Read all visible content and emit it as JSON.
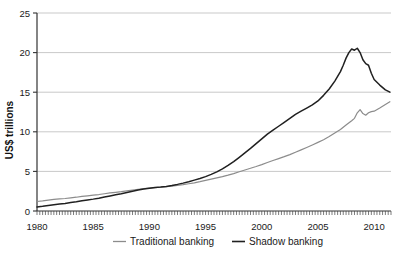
{
  "chart_data": {
    "type": "line",
    "title": "",
    "xlabel": "",
    "ylabel": "US$ trillions",
    "xlim": [
      1980,
      2011.5
    ],
    "ylim": [
      0,
      25
    ],
    "grid": true,
    "legend_position": "bottom",
    "y_ticks": [
      0,
      5,
      10,
      15,
      20,
      25
    ],
    "y_tick_labels": [
      "0",
      "5",
      "10",
      "15",
      "20",
      "25"
    ],
    "x_ticks": [
      1980,
      1985,
      1990,
      1995,
      2000,
      2005,
      2010
    ],
    "x_tick_labels": [
      "1980",
      "1985",
      "1990",
      "1995",
      "2000",
      "2005",
      "2010"
    ],
    "x_minor_tick_step": 0.25,
    "series": [
      {
        "name": "Traditional banking",
        "color": "#8c8c8c",
        "x": [
          1980,
          1980.5,
          1981,
          1981.5,
          1982,
          1982.5,
          1983,
          1983.5,
          1984,
          1984.5,
          1985,
          1985.5,
          1986,
          1986.5,
          1987,
          1987.5,
          1988,
          1988.5,
          1989,
          1989.5,
          1990,
          1990.5,
          1991,
          1991.5,
          1992,
          1992.5,
          1993,
          1993.5,
          1994,
          1994.5,
          1995,
          1995.5,
          1996,
          1996.5,
          1997,
          1997.5,
          1998,
          1998.5,
          1999,
          1999.5,
          2000,
          2000.5,
          2001,
          2001.5,
          2002,
          2002.5,
          2003,
          2003.5,
          2004,
          2004.5,
          2005,
          2005.5,
          2006,
          2006.5,
          2007,
          2007.5,
          2008,
          2008.25,
          2008.5,
          2008.75,
          2009,
          2009.25,
          2009.5,
          2009.75,
          2010,
          2010.5,
          2011,
          2011.4
        ],
        "y": [
          1.2,
          1.28,
          1.38,
          1.46,
          1.52,
          1.58,
          1.66,
          1.74,
          1.84,
          1.92,
          2.0,
          2.08,
          2.18,
          2.28,
          2.36,
          2.44,
          2.54,
          2.64,
          2.74,
          2.82,
          2.9,
          2.96,
          3.0,
          3.06,
          3.14,
          3.22,
          3.32,
          3.44,
          3.56,
          3.7,
          3.86,
          4.02,
          4.18,
          4.34,
          4.52,
          4.72,
          4.96,
          5.18,
          5.4,
          5.62,
          5.86,
          6.12,
          6.38,
          6.62,
          6.86,
          7.12,
          7.42,
          7.72,
          8.02,
          8.34,
          8.66,
          9.0,
          9.4,
          9.86,
          10.3,
          10.86,
          11.4,
          11.7,
          12.4,
          12.8,
          12.3,
          12.1,
          12.4,
          12.55,
          12.6,
          13.0,
          13.45,
          13.8
        ]
      },
      {
        "name": "Shadow banking",
        "color": "#202020",
        "x": [
          1980,
          1980.5,
          1981,
          1981.5,
          1982,
          1982.5,
          1983,
          1983.5,
          1984,
          1984.5,
          1985,
          1985.5,
          1986,
          1986.5,
          1987,
          1987.5,
          1988,
          1988.5,
          1989,
          1989.5,
          1990,
          1990.5,
          1991,
          1991.5,
          1992,
          1992.5,
          1993,
          1993.5,
          1994,
          1994.5,
          1995,
          1995.5,
          1996,
          1996.5,
          1997,
          1997.5,
          1998,
          1998.5,
          1999,
          1999.5,
          2000,
          2000.5,
          2001,
          2001.5,
          2002,
          2002.5,
          2003,
          2003.5,
          2004,
          2004.5,
          2005,
          2005.5,
          2006,
          2006.5,
          2007,
          2007.25,
          2007.5,
          2007.75,
          2008,
          2008.25,
          2008.5,
          2008.75,
          2009,
          2009.25,
          2009.5,
          2009.75,
          2010,
          2010.5,
          2011,
          2011.4
        ],
        "y": [
          0.52,
          0.6,
          0.7,
          0.8,
          0.88,
          0.96,
          1.06,
          1.16,
          1.28,
          1.4,
          1.5,
          1.62,
          1.76,
          1.9,
          2.04,
          2.18,
          2.34,
          2.5,
          2.66,
          2.78,
          2.88,
          2.96,
          3.02,
          3.1,
          3.22,
          3.36,
          3.52,
          3.7,
          3.9,
          4.1,
          4.34,
          4.62,
          4.94,
          5.32,
          5.76,
          6.24,
          6.78,
          7.34,
          7.9,
          8.5,
          9.1,
          9.7,
          10.2,
          10.7,
          11.2,
          11.7,
          12.2,
          12.6,
          13.0,
          13.4,
          13.9,
          14.6,
          15.4,
          16.4,
          17.6,
          18.4,
          19.3,
          20.0,
          20.45,
          20.3,
          20.55,
          20.0,
          19.1,
          18.6,
          18.4,
          17.4,
          16.6,
          15.9,
          15.3,
          15.0
        ]
      }
    ]
  },
  "legend": {
    "items": [
      {
        "label": "Traditional banking",
        "color": "#8c8c8c"
      },
      {
        "label": "Shadow banking",
        "color": "#202020"
      }
    ]
  },
  "axes": {
    "y_axis_title": "US$ trillions"
  }
}
